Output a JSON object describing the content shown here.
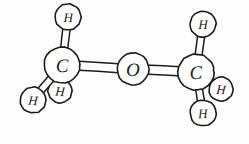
{
  "figure": {
    "style": "hand-drawn line art",
    "background_color": "#fdfdfd",
    "stroke_color": "#1c1c1c",
    "fill_color": "#ffffff",
    "width": 249,
    "height": 144
  },
  "molecule": {
    "name": "dimethyl ether",
    "formula": "CH3-O-CH3",
    "atoms": [
      {
        "id": "h1",
        "element": "H",
        "label": "H",
        "cx": 68,
        "cy": 17,
        "r": 13,
        "z": 2,
        "occluded": false
      },
      {
        "id": "c1",
        "element": "C",
        "label": "C",
        "cx": 62,
        "cy": 65,
        "r": 18,
        "z": 5,
        "occluded": false
      },
      {
        "id": "h2",
        "element": "H",
        "label": "H",
        "cx": 33,
        "cy": 100,
        "r": 13,
        "z": 3,
        "occluded": false
      },
      {
        "id": "h3",
        "element": "H",
        "label": "H",
        "cx": 60,
        "cy": 91,
        "r": 12,
        "z": 1,
        "occluded": true
      },
      {
        "id": "o1",
        "element": "O",
        "label": "O",
        "cx": 133,
        "cy": 69,
        "r": 16,
        "z": 5,
        "occluded": false
      },
      {
        "id": "c2",
        "element": "C",
        "label": "C",
        "cx": 196,
        "cy": 72,
        "r": 18,
        "z": 5,
        "occluded": false
      },
      {
        "id": "h4",
        "element": "H",
        "label": "H",
        "cx": 203,
        "cy": 24,
        "r": 13,
        "z": 2,
        "occluded": false
      },
      {
        "id": "h5",
        "element": "H",
        "label": "H",
        "cx": 221,
        "cy": 89,
        "r": 12,
        "z": 1,
        "occluded": true
      },
      {
        "id": "h6",
        "element": "H",
        "label": "H",
        "cx": 203,
        "cy": 113,
        "r": 13,
        "z": 3,
        "occluded": false
      }
    ],
    "bonds": [
      {
        "id": "b1",
        "from": "c1",
        "to": "h1",
        "order": 1,
        "style": "tube",
        "width": 7
      },
      {
        "id": "b2",
        "from": "c1",
        "to": "h2",
        "order": 1,
        "style": "tube",
        "width": 7
      },
      {
        "id": "b3",
        "from": "c1",
        "to": "h3",
        "order": 1,
        "style": "tube",
        "width": 7
      },
      {
        "id": "b4",
        "from": "c1",
        "to": "o1",
        "order": 1,
        "style": "tube",
        "width": 9
      },
      {
        "id": "b5",
        "from": "o1",
        "to": "c2",
        "order": 1,
        "style": "tube",
        "width": 9
      },
      {
        "id": "b6",
        "from": "c2",
        "to": "h4",
        "order": 1,
        "style": "tube",
        "width": 7
      },
      {
        "id": "b7",
        "from": "c2",
        "to": "h5",
        "order": 1,
        "style": "tube",
        "width": 7
      },
      {
        "id": "b8",
        "from": "c2",
        "to": "h6",
        "order": 1,
        "style": "tube",
        "width": 7
      }
    ]
  }
}
